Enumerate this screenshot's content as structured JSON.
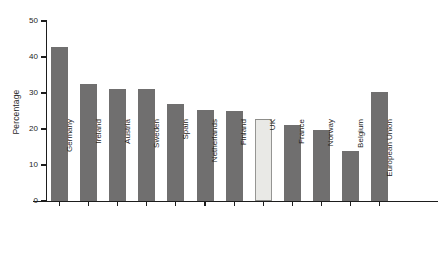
{
  "chart_data": {
    "type": "bar",
    "title": "",
    "subtitle": "",
    "xlabel": "",
    "ylabel": "Percentage",
    "ylim": [
      0,
      50
    ],
    "yticks": [
      0,
      10,
      20,
      30,
      40,
      50
    ],
    "ytick_labels": [
      "0",
      "10",
      "20",
      "30",
      "40",
      "50"
    ],
    "grid": false,
    "legend": false,
    "legend_position": "none",
    "categories": [
      "Germany",
      "Ireland",
      "Austria",
      "Sweden",
      "Spain",
      "Netherlands",
      "Finland",
      "UK",
      "France",
      "Norway",
      "Belgium",
      "European Union"
    ],
    "values": [
      42.7,
      32.5,
      31.0,
      31.0,
      27.0,
      25.2,
      25.0,
      22.7,
      21.0,
      19.7,
      13.8,
      30.3
    ],
    "highlighted_category": "UK",
    "bar_color": "#706f6f",
    "highlight_bar_color": "#e9e9e6",
    "highlight_bar_border_color": "#8d8d8a",
    "axis_color": "#1d1d1d",
    "background_color": "#ffffff"
  }
}
